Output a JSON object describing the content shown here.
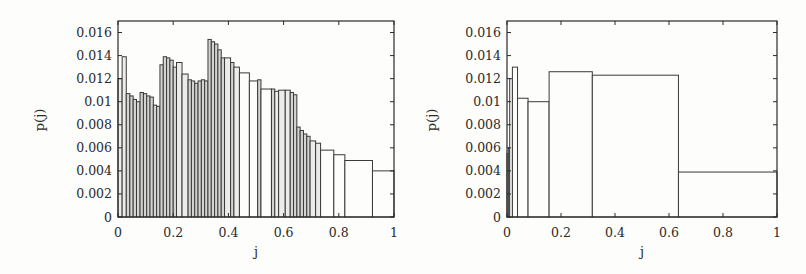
{
  "chart_data": [
    {
      "type": "bar",
      "subtype": "variable-width histogram",
      "title": "",
      "xlabel": "j",
      "ylabel": "p(j)",
      "xlim": [
        0,
        1
      ],
      "ylim": [
        0,
        0.017
      ],
      "xticks": [
        "0",
        "0.2",
        "0.4",
        "0.6",
        "0.8",
        "1"
      ],
      "yticks": [
        "0",
        "0.002",
        "0.004",
        "0.006",
        "0.008",
        "0.01",
        "0.012",
        "0.014",
        "0.016"
      ],
      "grid": false,
      "legend": null,
      "bins": [
        {
          "x0": 0.0,
          "x1": 0.015,
          "value": 0.012
        },
        {
          "x0": 0.015,
          "x1": 0.03,
          "value": 0.0139
        },
        {
          "x0": 0.03,
          "x1": 0.043,
          "value": 0.0107
        },
        {
          "x0": 0.043,
          "x1": 0.055,
          "value": 0.0105
        },
        {
          "x0": 0.055,
          "x1": 0.067,
          "value": 0.0102
        },
        {
          "x0": 0.067,
          "x1": 0.08,
          "value": 0.01
        },
        {
          "x0": 0.08,
          "x1": 0.092,
          "value": 0.0108
        },
        {
          "x0": 0.092,
          "x1": 0.104,
          "value": 0.0107
        },
        {
          "x0": 0.104,
          "x1": 0.116,
          "value": 0.0105
        },
        {
          "x0": 0.116,
          "x1": 0.128,
          "value": 0.0104
        },
        {
          "x0": 0.128,
          "x1": 0.14,
          "value": 0.0097
        },
        {
          "x0": 0.14,
          "x1": 0.152,
          "value": 0.0096
        },
        {
          "x0": 0.152,
          "x1": 0.164,
          "value": 0.0132
        },
        {
          "x0": 0.164,
          "x1": 0.176,
          "value": 0.0139
        },
        {
          "x0": 0.176,
          "x1": 0.188,
          "value": 0.0138
        },
        {
          "x0": 0.188,
          "x1": 0.2,
          "value": 0.0136
        },
        {
          "x0": 0.2,
          "x1": 0.212,
          "value": 0.013
        },
        {
          "x0": 0.212,
          "x1": 0.232,
          "value": 0.0134
        },
        {
          "x0": 0.232,
          "x1": 0.254,
          "value": 0.0124
        },
        {
          "x0": 0.254,
          "x1": 0.266,
          "value": 0.0119
        },
        {
          "x0": 0.266,
          "x1": 0.278,
          "value": 0.0118
        },
        {
          "x0": 0.278,
          "x1": 0.29,
          "value": 0.0116
        },
        {
          "x0": 0.29,
          "x1": 0.302,
          "value": 0.0118
        },
        {
          "x0": 0.302,
          "x1": 0.314,
          "value": 0.0119
        },
        {
          "x0": 0.314,
          "x1": 0.326,
          "value": 0.0118
        },
        {
          "x0": 0.326,
          "x1": 0.338,
          "value": 0.0154
        },
        {
          "x0": 0.338,
          "x1": 0.35,
          "value": 0.0152
        },
        {
          "x0": 0.35,
          "x1": 0.362,
          "value": 0.015
        },
        {
          "x0": 0.362,
          "x1": 0.374,
          "value": 0.0145
        },
        {
          "x0": 0.374,
          "x1": 0.386,
          "value": 0.0138
        },
        {
          "x0": 0.386,
          "x1": 0.408,
          "value": 0.0138
        },
        {
          "x0": 0.408,
          "x1": 0.42,
          "value": 0.0134
        },
        {
          "x0": 0.42,
          "x1": 0.44,
          "value": 0.013
        },
        {
          "x0": 0.44,
          "x1": 0.476,
          "value": 0.0125
        },
        {
          "x0": 0.476,
          "x1": 0.506,
          "value": 0.0118
        },
        {
          "x0": 0.506,
          "x1": 0.518,
          "value": 0.0119
        },
        {
          "x0": 0.518,
          "x1": 0.556,
          "value": 0.0111
        },
        {
          "x0": 0.556,
          "x1": 0.568,
          "value": 0.0111
        },
        {
          "x0": 0.568,
          "x1": 0.582,
          "value": 0.0109
        },
        {
          "x0": 0.582,
          "x1": 0.606,
          "value": 0.011
        },
        {
          "x0": 0.606,
          "x1": 0.624,
          "value": 0.011
        },
        {
          "x0": 0.624,
          "x1": 0.636,
          "value": 0.0108
        },
        {
          "x0": 0.636,
          "x1": 0.648,
          "value": 0.0106
        },
        {
          "x0": 0.648,
          "x1": 0.66,
          "value": 0.0078
        },
        {
          "x0": 0.66,
          "x1": 0.672,
          "value": 0.0075
        },
        {
          "x0": 0.672,
          "x1": 0.684,
          "value": 0.0072
        },
        {
          "x0": 0.684,
          "x1": 0.696,
          "value": 0.007
        },
        {
          "x0": 0.696,
          "x1": 0.716,
          "value": 0.0066
        },
        {
          "x0": 0.716,
          "x1": 0.734,
          "value": 0.0064
        },
        {
          "x0": 0.734,
          "x1": 0.782,
          "value": 0.0058
        },
        {
          "x0": 0.782,
          "x1": 0.822,
          "value": 0.0054
        },
        {
          "x0": 0.822,
          "x1": 0.922,
          "value": 0.0049
        },
        {
          "x0": 0.922,
          "x1": 1.0,
          "value": 0.004
        }
      ]
    },
    {
      "type": "bar",
      "subtype": "variable-width histogram",
      "title": "",
      "xlabel": "j",
      "ylabel": "p(j)",
      "xlim": [
        0,
        1
      ],
      "ylim": [
        0,
        0.017
      ],
      "xticks": [
        "0",
        "0.2",
        "0.4",
        "0.6",
        "0.8",
        "1"
      ],
      "yticks": [
        "0",
        "0.002",
        "0.004",
        "0.006",
        "0.008",
        "0.01",
        "0.012",
        "0.014",
        "0.016"
      ],
      "grid": false,
      "legend": null,
      "bins": [
        {
          "x0": 0.0,
          "x1": 0.005,
          "value": 0.0055
        },
        {
          "x0": 0.005,
          "x1": 0.01,
          "value": 0.006
        },
        {
          "x0": 0.01,
          "x1": 0.02,
          "value": 0.012
        },
        {
          "x0": 0.02,
          "x1": 0.039,
          "value": 0.013
        },
        {
          "x0": 0.039,
          "x1": 0.078,
          "value": 0.0103
        },
        {
          "x0": 0.078,
          "x1": 0.156,
          "value": 0.01
        },
        {
          "x0": 0.156,
          "x1": 0.316,
          "value": 0.0126
        },
        {
          "x0": 0.316,
          "x1": 0.635,
          "value": 0.0123
        },
        {
          "x0": 0.635,
          "x1": 1.0,
          "value": 0.0039
        }
      ]
    }
  ],
  "panels": [
    {
      "name": "left",
      "ylabel": "p(j)",
      "xlabel": "j"
    },
    {
      "name": "right",
      "ylabel": "p(j)",
      "xlabel": "j"
    }
  ]
}
